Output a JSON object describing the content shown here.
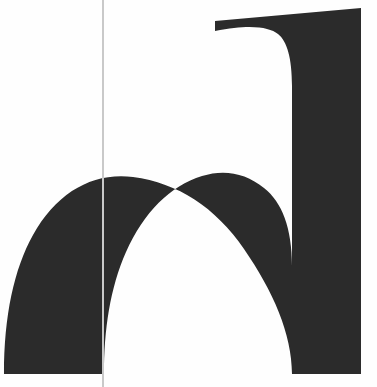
{
  "artwork": {
    "kind": "typographic-specimen",
    "glyph_character": "n",
    "glyph_name": "latin-small-letter-n",
    "script": "Latin",
    "style": "serif",
    "case": "lowercase",
    "description": "Large cropped serif lowercase letter n",
    "alt_text": "Oversized dark serif lowercase letter n cropped at the baseline, with a thin vertical grey rule crossing the page"
  },
  "canvas": {
    "width": 377,
    "height": 387,
    "background_color": "#fefefe"
  },
  "colors": {
    "glyph_fill": "#2b2b2b",
    "background": "#fefefe",
    "rule_line": "#c9c9c9"
  },
  "guide_rule": {
    "name": "vertical-rule",
    "x": 102,
    "thickness": 2,
    "color": "#c9c9c9",
    "top": 0,
    "bottom": 387
  },
  "glyph_geometry": {
    "stem_left": {
      "top_x": 33,
      "bottom_left_x": 4,
      "bottom_right_x": 86,
      "baseline_y": 374
    },
    "stem_right": {
      "left_x": 296,
      "right_x": 361,
      "top_y": 8,
      "baseline_y": 374
    },
    "arch": {
      "apex_outer_y": 176,
      "apex_inner_y": 190,
      "apex_x": 192,
      "thickness_top": 14
    },
    "flag_serif": {
      "tip_x": 215,
      "tip_y_top": 21,
      "tip_y_bottom": 31
    },
    "counter": {
      "top_y": 190,
      "left_x": 88,
      "right_x": 292,
      "bottom_y": 374
    }
  },
  "paths": {
    "glyph": "M 215 21 L 361 8 L 361 374 L 292 374 L 292 266 C 292 230 282 204 266 190 C 250 177 230 172 210 176 C 178 182 150 206 130 244 C 112 278 104 320 104 374 L 4 374 C 4 318 13 272 30 238 C 50 199 82 174 120 181 L 120 181 C 152 187 176 205 196 234 L 196 234 C 208 251 221 258 246 258 L 292 258 L 292 80 C 292 56 288 40 280 33 C 272 26 255 23 215 31 Z",
    "glyph_outer": "M 215 21 L 361 8 L 361 374 L 292 374 L 292 86 C 292 58 287 41 278 34 C 269 27 250 24 215 31 Z",
    "arch_stroke": "M 4 374 C 4 316 14 269 33 235 C 57 192 93 172 133 177 C 178 183 215 207 244 249 C 273 291 292 334 292 374 L 292 266 C 292 228 282 202 264 188 C 246 173 224 169 202 176 C 170 186 144 212 126 252 C 110 288 104 330 104 374 Z"
  }
}
